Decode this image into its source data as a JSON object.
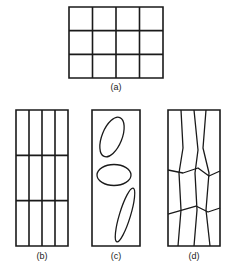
{
  "figure": {
    "background_color": "#ffffff",
    "stroke_color": "#1a1a1a",
    "label_color": "#1a1a1a",
    "panels": [
      {
        "id": "a",
        "label": "(a)",
        "description": "regular rectangular grid, 4 columns by 3 rows",
        "x": 69,
        "y": 7,
        "width": 94,
        "height": 71,
        "columns": 4,
        "rows": 3,
        "stroke_width": 1.6,
        "label_x": 69,
        "label_y": 82,
        "vertical_fractions": [
          0.25,
          0.5,
          0.75
        ],
        "horizontal_fractions": [
          0.3333,
          0.6667
        ]
      },
      {
        "id": "b",
        "label": "(b)",
        "description": "tall rectangle, 4 narrow columns by 3 rows",
        "x": 16,
        "y": 110,
        "width": 52,
        "height": 136,
        "columns": 4,
        "rows": 3,
        "stroke_width": 1.6,
        "label_x": 16,
        "label_y": 251,
        "vertical_fractions": [
          0.25,
          0.5,
          0.75
        ],
        "horizontal_fractions": [
          0.3333,
          0.6667
        ]
      },
      {
        "id": "c",
        "label": "(c)",
        "description": "tall rectangle containing three ellipses of varied orientation",
        "x": 92,
        "y": 110,
        "width": 48,
        "height": 136,
        "stroke_width": 1.6,
        "label_x": 92,
        "label_y": 251,
        "ellipses": [
          {
            "name": "ellipse-upper-tilted",
            "cx": 112,
            "cy": 137,
            "rx": 10,
            "ry": 21,
            "rotate": 22,
            "stroke_width": 1.3
          },
          {
            "name": "ellipse-middle-horizontal",
            "cx": 114,
            "cy": 175,
            "rx": 17,
            "ry": 10.5,
            "rotate": 0,
            "stroke_width": 1.3
          },
          {
            "name": "ellipse-lower-slender",
            "cx": 125,
            "cy": 215,
            "rx": 5.5,
            "ry": 28,
            "rotate": 17,
            "stroke_width": 1.3
          }
        ]
      },
      {
        "id": "d",
        "label": "(d)",
        "description": "tall rectangle with irregular, non-orthogonal quadrilateral cells",
        "x": 168,
        "y": 110,
        "width": 52,
        "height": 136,
        "stroke_width": 1.6,
        "label_x": 168,
        "label_y": 251,
        "irregular_vertical_paths": [
          [
            [
              13,
              0
            ],
            [
              15,
              38
            ],
            [
              11,
              63
            ],
            [
              13,
              100
            ],
            [
              10,
              136
            ]
          ],
          [
            [
              26,
              0
            ],
            [
              30,
              40
            ],
            [
              27,
              63
            ],
            [
              29,
              100
            ],
            [
              26,
              136
            ]
          ],
          [
            [
              38,
              0
            ],
            [
              35,
              38
            ],
            [
              41,
              63
            ],
            [
              38,
              100
            ],
            [
              42,
              136
            ]
          ]
        ],
        "irregular_horizontal_paths": [
          [
            [
              0,
              60
            ],
            [
              15,
              63
            ],
            [
              30,
              58
            ],
            [
              41,
              66
            ],
            [
              52,
              61
            ]
          ],
          [
            [
              0,
              104
            ],
            [
              14,
              100
            ],
            [
              28,
              96
            ],
            [
              40,
              102
            ],
            [
              52,
              98
            ]
          ]
        ]
      }
    ]
  }
}
